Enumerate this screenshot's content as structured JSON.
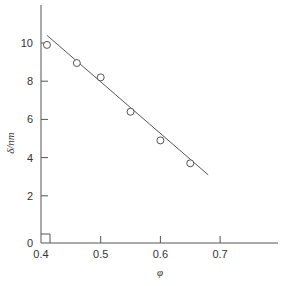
{
  "chart_data": {
    "type": "scatter",
    "title": "",
    "xlabel": "φ",
    "ylabel": "δ/nm",
    "xlim": [
      0.4,
      0.8
    ],
    "ylim": [
      0,
      12
    ],
    "x_ticks": [
      0.4,
      0.5,
      0.6,
      0.7
    ],
    "x_tick_labels": [
      "0.4",
      "0.5",
      "0.6",
      "0.7"
    ],
    "y_ticks": [
      0,
      2,
      4,
      6,
      8,
      10
    ],
    "y_tick_labels": [
      "0",
      "2",
      "4",
      "6",
      "8",
      "10"
    ],
    "grid": false,
    "legend": null,
    "axis_break_marker": true,
    "series": [
      {
        "name": "data",
        "marker": "open-circle",
        "x": [
          0.41,
          0.46,
          0.5,
          0.55,
          0.6,
          0.65
        ],
        "y": [
          9.9,
          8.95,
          8.2,
          6.4,
          4.9,
          3.7
        ]
      },
      {
        "name": "linear fit",
        "style": "line",
        "x": [
          0.41,
          0.68
        ],
        "y": [
          10.4,
          3.1
        ]
      }
    ]
  },
  "colors": {
    "axis": "#555555",
    "line": "#555555",
    "marker_stroke": "#555555",
    "text": "#333333"
  }
}
